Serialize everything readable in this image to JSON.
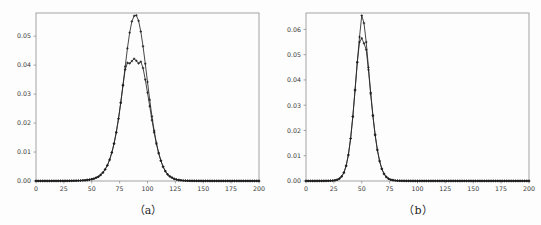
{
  "figure": {
    "background_color": "#fdfdfd",
    "axis_color": "#9a9a9a",
    "series_color": "#262626",
    "panels": [
      {
        "id": "a",
        "caption": "（a）"
      },
      {
        "id": "b",
        "caption": "（b）"
      }
    ]
  },
  "chart_data": [
    {
      "type": "line",
      "panel": "a",
      "title": "",
      "subtitle": "",
      "caption": "（a）",
      "xlabel": "",
      "ylabel": "",
      "grid": false,
      "legend": "none",
      "marker": "plus",
      "xlim": [
        0,
        200
      ],
      "ylim": [
        0.0,
        0.058
      ],
      "xticks": [
        0,
        25,
        50,
        75,
        100,
        125,
        150,
        175,
        200
      ],
      "xticklabels": [
        "0",
        "25",
        "50",
        "75",
        "100",
        "125",
        "150",
        "175",
        "200"
      ],
      "yticks": [
        0.0,
        0.01,
        0.02,
        0.03,
        0.04,
        0.05
      ],
      "yticklabels": [
        "0.00",
        "0.01",
        "0.02",
        "0.03",
        "0.04",
        "0.05"
      ],
      "x": [
        0,
        4,
        8,
        12,
        16,
        20,
        24,
        28,
        32,
        36,
        40,
        44,
        48,
        52,
        56,
        58,
        60,
        62,
        64,
        66,
        68,
        70,
        72,
        74,
        76,
        78,
        80,
        82,
        84,
        86,
        88,
        90,
        92,
        94,
        96,
        98,
        100,
        102,
        104,
        106,
        108,
        110,
        112,
        114,
        116,
        118,
        120,
        124,
        128,
        132,
        136,
        140,
        150,
        160,
        170,
        180,
        190,
        200
      ],
      "series": [
        {
          "name": "curve-1-high-peak",
          "peak_x": 89,
          "peak_y": 0.0572,
          "values": [
            2e-05,
            2e-05,
            2e-05,
            2e-05,
            3e-05,
            3e-05,
            4e-05,
            5e-05,
            7e-05,
            0.0001,
            0.00016,
            0.00026,
            0.00045,
            0.0008,
            0.0015,
            0.0021,
            0.0029,
            0.004,
            0.0054,
            0.0073,
            0.0098,
            0.0129,
            0.0168,
            0.0215,
            0.027,
            0.0331,
            0.0395,
            0.0458,
            0.0512,
            0.0551,
            0.057,
            0.0572,
            0.0553,
            0.0516,
            0.0465,
            0.0405,
            0.0342,
            0.028,
            0.0223,
            0.0173,
            0.0131,
            0.0097,
            0.007,
            0.0049,
            0.0034,
            0.0023,
            0.0016,
            0.0007,
            0.00032,
            0.00015,
            8e-05,
            5e-05,
            3e-05,
            2e-05,
            2e-05,
            2e-05,
            2e-05,
            2e-05
          ]
        },
        {
          "name": "curve-2-low-peak",
          "peak_x": 89,
          "peak_y": 0.0422,
          "values": [
            2e-05,
            2e-05,
            2e-05,
            2e-05,
            3e-05,
            3e-05,
            4e-05,
            5e-05,
            7e-05,
            0.0001,
            0.00016,
            0.00026,
            0.00045,
            0.0008,
            0.0015,
            0.0021,
            0.0029,
            0.004,
            0.0054,
            0.0073,
            0.0098,
            0.0129,
            0.0168,
            0.0215,
            0.027,
            0.033,
            0.0385,
            0.0408,
            0.0406,
            0.0414,
            0.0422,
            0.0415,
            0.0406,
            0.0412,
            0.039,
            0.035,
            0.0305,
            0.0258,
            0.021,
            0.0167,
            0.0128,
            0.0096,
            0.007,
            0.0049,
            0.0034,
            0.0023,
            0.0016,
            0.0007,
            0.00032,
            0.00015,
            8e-05,
            5e-05,
            3e-05,
            2e-05,
            2e-05,
            2e-05,
            2e-05,
            2e-05
          ]
        }
      ]
    },
    {
      "type": "line",
      "panel": "b",
      "title": "",
      "subtitle": "",
      "caption": "（b）",
      "xlabel": "",
      "ylabel": "",
      "grid": false,
      "legend": "none",
      "marker": "plus",
      "xlim": [
        0,
        200
      ],
      "ylim": [
        0.0,
        0.0665
      ],
      "xticks": [
        0,
        25,
        50,
        75,
        100,
        125,
        150,
        175,
        200
      ],
      "xticklabels": [
        "0",
        "25",
        "50",
        "75",
        "100",
        "125",
        "150",
        "175",
        "200"
      ],
      "yticks": [
        0.0,
        0.01,
        0.02,
        0.03,
        0.04,
        0.05,
        0.06
      ],
      "yticklabels": [
        "0.00",
        "0.01",
        "0.02",
        "0.03",
        "0.04",
        "0.05",
        "0.06"
      ],
      "x": [
        0,
        4,
        8,
        12,
        16,
        20,
        24,
        26,
        28,
        30,
        32,
        34,
        36,
        38,
        40,
        42,
        44,
        46,
        48,
        50,
        52,
        54,
        56,
        58,
        60,
        62,
        64,
        66,
        68,
        70,
        72,
        74,
        76,
        80,
        84,
        88,
        92,
        100,
        110,
        120,
        130,
        140,
        150,
        160,
        170,
        180,
        190,
        200
      ],
      "series": [
        {
          "name": "curve-1-high-peak",
          "peak_x": 50,
          "peak_y": 0.0655,
          "values": [
            2e-05,
            2e-05,
            2e-05,
            3e-05,
            4e-05,
            7e-05,
            0.00016,
            0.00028,
            0.0005,
            0.00095,
            0.0018,
            0.0033,
            0.006,
            0.0103,
            0.0168,
            0.0255,
            0.036,
            0.047,
            0.057,
            0.0655,
            0.0625,
            0.055,
            0.045,
            0.035,
            0.026,
            0.0183,
            0.0123,
            0.0079,
            0.0048,
            0.0028,
            0.0016,
            0.0009,
            0.0005,
            0.00018,
            8e-05,
            5e-05,
            3e-05,
            2e-05,
            2e-05,
            2e-05,
            2e-05,
            2e-05,
            2e-05,
            2e-05,
            2e-05,
            2e-05,
            2e-05,
            2e-05
          ]
        },
        {
          "name": "curve-2-low-peak",
          "peak_x": 49,
          "peak_y": 0.0565,
          "values": [
            2e-05,
            2e-05,
            2e-05,
            3e-05,
            4e-05,
            7e-05,
            0.00016,
            0.00028,
            0.0005,
            0.00095,
            0.0018,
            0.0033,
            0.006,
            0.0103,
            0.0168,
            0.0255,
            0.036,
            0.047,
            0.055,
            0.0565,
            0.0545,
            0.052,
            0.044,
            0.0345,
            0.0258,
            0.0182,
            0.0123,
            0.0079,
            0.0048,
            0.0028,
            0.0016,
            0.0009,
            0.0005,
            0.00018,
            8e-05,
            5e-05,
            3e-05,
            2e-05,
            2e-05,
            2e-05,
            2e-05,
            2e-05,
            2e-05,
            2e-05,
            2e-05,
            2e-05,
            2e-05,
            2e-05
          ]
        }
      ]
    }
  ]
}
